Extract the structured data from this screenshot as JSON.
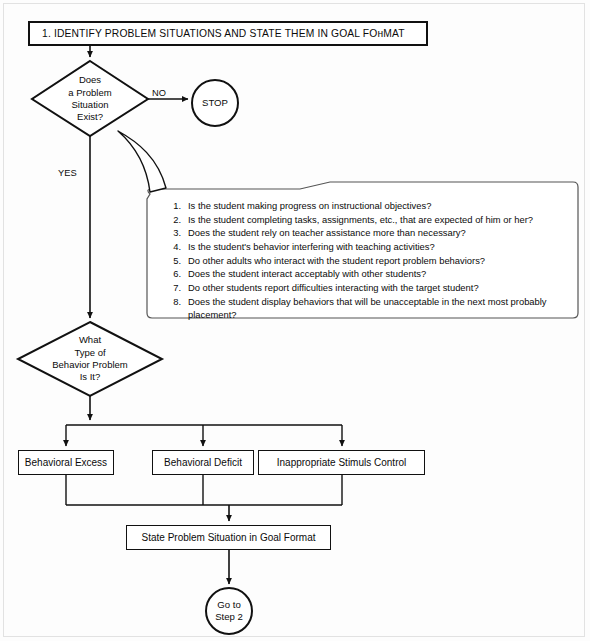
{
  "title_box": {
    "label": "1.  IDENTIFY PROBLEM SITUATIONS AND STATE THEM IN GOAL FOнMAT"
  },
  "decision_1": {
    "line1": "Does",
    "line2": "a Problem",
    "line3": "Situation",
    "line4": "Exist?"
  },
  "decision_2": {
    "line1": "What",
    "line2": "Type of",
    "line3": "Behavior Problem",
    "line4": "Is It?"
  },
  "terminator_stop": {
    "label": "STOP"
  },
  "terminator_goto": {
    "line1": "Go to",
    "line2": "Step 2"
  },
  "edge_labels": {
    "no": "NO",
    "yes": "YES"
  },
  "outcome_boxes": {
    "excess": "Behavioral Excess",
    "deficit": "Behavioral Deficit",
    "stimulus": "Inappropriate Stimuls Control"
  },
  "goal_box": {
    "label": "State Problem Situation in Goal Format"
  },
  "callout": {
    "items": [
      {
        "num": "1.",
        "text": "Is the student making progress on instructional objectives?"
      },
      {
        "num": "2.",
        "text": "Is the student completing tasks, assignments, etc., that are expected of him or her?"
      },
      {
        "num": "3.",
        "text": "Does the student rely on teacher assistance more than necessary?"
      },
      {
        "num": "4.",
        "text": "Is the student's behavior interfering with teaching activities?"
      },
      {
        "num": "5.",
        "text": "Do other adults who interact with the student report problem behaviors?"
      },
      {
        "num": "6.",
        "text": "Does the student interact acceptably with other students?"
      },
      {
        "num": "7.",
        "text": "Do other students report difficulties interacting with the target student?"
      },
      {
        "num": "8.",
        "text": "Does the student display behaviors that will be unacceptable in the next most probably placement?"
      }
    ]
  },
  "colors": {
    "stroke": "#111111",
    "page_background": "#fdfdfd",
    "text": "#0b0b0b"
  }
}
